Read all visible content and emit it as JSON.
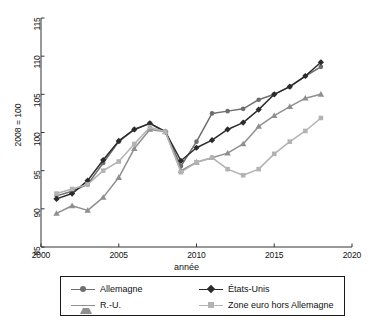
{
  "chart_data": {
    "type": "line",
    "title": "",
    "xlabel": "année",
    "ylabel": "2008 = 100",
    "xlim": [
      2000,
      2020
    ],
    "ylim": [
      85,
      115
    ],
    "xticks": [
      2000,
      2005,
      2010,
      2015,
      2020
    ],
    "yticks": [
      85,
      90,
      95,
      100,
      105,
      110,
      115
    ],
    "grid": false,
    "legend_position": "bottom",
    "x": [
      2001,
      2002,
      2003,
      2004,
      2005,
      2006,
      2007,
      2008,
      2009,
      2010,
      2011,
      2012,
      2013,
      2014,
      2015,
      2016,
      2017,
      2018
    ],
    "series": [
      {
        "name": "Allemagne",
        "marker": "circle",
        "color": "#6e6e6e",
        "values": [
          91.7,
          92.3,
          93.2,
          96.0,
          98.8,
          100.4,
          101.2,
          100.1,
          95.6,
          98.8,
          102.5,
          102.8,
          103.1,
          104.3,
          105.0,
          106.0,
          107.4,
          108.6
        ]
      },
      {
        "name": "États-Unis",
        "marker": "diamond",
        "color": "#2b2b2b",
        "values": [
          91.3,
          92.0,
          93.7,
          96.4,
          98.9,
          100.4,
          101.2,
          100.1,
          96.3,
          98.0,
          99.0,
          100.4,
          101.3,
          103.0,
          105.0,
          106.0,
          107.4,
          109.2
        ]
      },
      {
        "name": "R.-U.",
        "marker": "triangle",
        "color": "#8f8f8f",
        "values": [
          89.4,
          90.4,
          89.8,
          91.5,
          94.1,
          97.9,
          100.4,
          100.1,
          95.0,
          96.1,
          96.7,
          97.3,
          98.5,
          100.8,
          102.2,
          103.4,
          104.5,
          105.0
        ]
      },
      {
        "name": "Zone euro hors Allemagne",
        "marker": "square",
        "color": "#b3b3b3",
        "values": [
          92.0,
          92.6,
          93.2,
          95.0,
          96.2,
          98.5,
          100.7,
          100.1,
          94.8,
          96.1,
          96.7,
          95.2,
          94.4,
          95.2,
          97.2,
          98.8,
          100.2,
          101.9
        ]
      }
    ]
  },
  "axis": {
    "y_label": "2008 = 100",
    "x_label": "année",
    "y_ticks": [
      "85",
      "90",
      "95",
      "100",
      "105",
      "110",
      "115"
    ],
    "x_ticks": [
      "2000",
      "2005",
      "2010",
      "2015",
      "2020"
    ]
  },
  "legend": {
    "items": [
      {
        "label": "Allemagne"
      },
      {
        "label": "États-Unis"
      },
      {
        "label": "R.-U."
      },
      {
        "label": "Zone euro hors Allemagne"
      }
    ]
  }
}
